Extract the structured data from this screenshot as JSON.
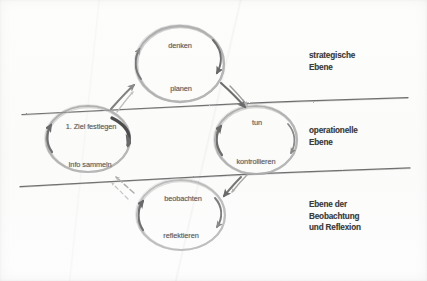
{
  "diagram": {
    "medium": "pencil-sketch-scan",
    "background_color": "#fcfcfb",
    "pencil_color": "#8c8c8c",
    "ink_color": "#3b3b3b",
    "bands": [
      {
        "id": "band-strategic",
        "label": "strategische\nEbene"
      },
      {
        "id": "band-operational",
        "label": "operationelle\nEbene"
      },
      {
        "id": "band-observation",
        "label": "Ebene der\nBeobachtung\nund Reflexion"
      }
    ],
    "dividers": [
      {
        "id": "divider-upper",
        "from": "strategische Ebene",
        "to": "operationelle Ebene"
      },
      {
        "id": "divider-lower",
        "from": "operationelle Ebene",
        "to": "Ebene der Beobachtung und Reflexion"
      }
    ],
    "cycles": [
      {
        "id": "cycle-denken-planen",
        "band": "strategische Ebene",
        "top_label": "denken",
        "bottom_label": "planen"
      },
      {
        "id": "cycle-ziel-info",
        "band": "operationelle Ebene",
        "top_label": "1. Ziel festlegen",
        "bottom_label": "Info sammeln"
      },
      {
        "id": "cycle-tun-kontrollieren",
        "band": "operationelle Ebene",
        "top_label": "tun",
        "bottom_label": "kontrollieren"
      },
      {
        "id": "cycle-beobachten-reflektieren",
        "band": "Ebene der Beobachtung und Reflexion",
        "top_label": "beobachten",
        "bottom_label": "reflektieren"
      }
    ],
    "connectors": [
      {
        "id": "connector-ziel-to-denken",
        "from": "1. Ziel festlegen",
        "to": "denken",
        "style": "solid-pencil"
      },
      {
        "id": "connector-planen-to-tun",
        "from": "planen",
        "to": "tun",
        "style": "solid-pencil"
      },
      {
        "id": "connector-kontrollieren-to-beobachten",
        "from": "kontrollieren",
        "to": "beobachten",
        "style": "solid-pencil"
      },
      {
        "id": "connector-reflektieren-to-info",
        "from": "reflektieren",
        "to": "Info sammeln",
        "style": "faint-dashed"
      }
    ]
  }
}
